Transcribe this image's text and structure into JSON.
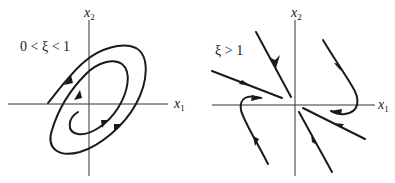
{
  "figure": {
    "panels": [
      {
        "id": "underdamped",
        "condition": "0 < ξ < 1",
        "x_axis_label": "x",
        "x_axis_sub": "1",
        "y_axis_label": "x",
        "y_axis_sub": "2",
        "portrait_type": "stable focus (spiral toward origin)"
      },
      {
        "id": "overdamped",
        "condition": "ξ > 1",
        "x_axis_label": "x",
        "x_axis_sub": "1",
        "y_axis_label": "x",
        "y_axis_sub": "2",
        "portrait_type": "stable node (trajectories converge to origin)"
      }
    ],
    "colors": {
      "stroke": "#1a1a1a",
      "axis": "#333333",
      "background": "#ffffff"
    }
  }
}
